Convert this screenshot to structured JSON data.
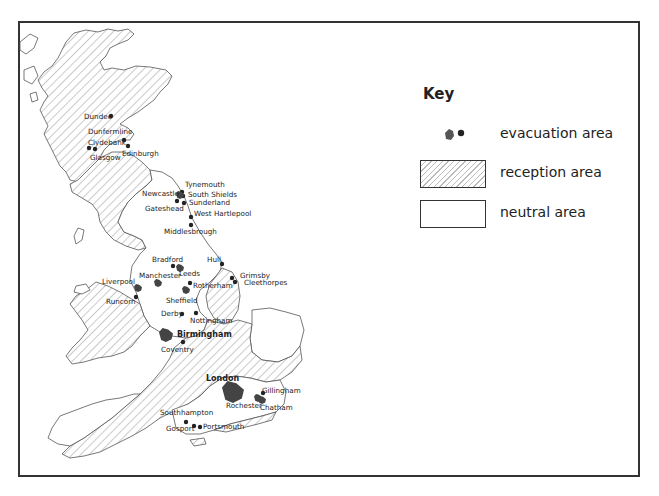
{
  "key": {
    "title": "Key",
    "items": [
      {
        "symbol": "evacuation-symbol",
        "label": "evacuation area"
      },
      {
        "symbol": "hatched-swatch",
        "label": "reception area"
      },
      {
        "symbol": "blank-swatch",
        "label": "neutral area"
      }
    ]
  },
  "colors": {
    "border": "#333333",
    "evacuation": "#444444",
    "hatch": "#999999",
    "background": "#ffffff"
  },
  "cities": [
    {
      "name": "Dundee",
      "x": 111,
      "y": 116,
      "lx": 84,
      "ly": 119,
      "type": "dot"
    },
    {
      "name": "Dunfermline",
      "x": 124,
      "y": 140,
      "lx": 88,
      "ly": 134,
      "type": "dot"
    },
    {
      "name": "Clydebank",
      "x": 89,
      "y": 148,
      "lx": 88,
      "ly": 145,
      "type": "dot"
    },
    {
      "name": "Glasgow",
      "x": 95,
      "y": 149,
      "lx": 90,
      "ly": 160,
      "type": "dot"
    },
    {
      "name": "Edinburgh",
      "x": 128,
      "y": 146,
      "lx": 122,
      "ly": 156,
      "type": "dot"
    },
    {
      "name": "Tynemouth",
      "x": 182,
      "y": 192,
      "lx": 185,
      "ly": 187,
      "type": "dot"
    },
    {
      "name": "South Shields",
      "x": 183,
      "y": 196,
      "lx": 188,
      "ly": 197,
      "type": "dot"
    },
    {
      "name": "Newcastle",
      "x": 180,
      "y": 195,
      "lx": 142,
      "ly": 196,
      "type": "area"
    },
    {
      "name": "Sunderland",
      "x": 184,
      "y": 203,
      "lx": 189,
      "ly": 205,
      "type": "dot"
    },
    {
      "name": "Gateshead",
      "x": 177,
      "y": 201,
      "lx": 145,
      "ly": 211,
      "type": "dot"
    },
    {
      "name": "West Hartlepool",
      "x": 191,
      "y": 217,
      "lx": 194,
      "ly": 216,
      "type": "dot"
    },
    {
      "name": "Middlesbrough",
      "x": 191,
      "y": 225,
      "lx": 164,
      "ly": 234,
      "type": "dot"
    },
    {
      "name": "Bradford",
      "x": 173,
      "y": 266,
      "lx": 152,
      "ly": 262,
      "type": "dot"
    },
    {
      "name": "Leeds",
      "x": 180,
      "y": 268,
      "lx": 179,
      "ly": 276,
      "type": "area"
    },
    {
      "name": "Hull",
      "x": 222,
      "y": 264,
      "lx": 207,
      "ly": 262,
      "type": "dot"
    },
    {
      "name": "Grimsby",
      "x": 232,
      "y": 278,
      "lx": 240,
      "ly": 278,
      "type": "dot"
    },
    {
      "name": "Cleethorpes",
      "x": 235,
      "y": 282,
      "lx": 244,
      "ly": 285,
      "type": "dot"
    },
    {
      "name": "Liverpool",
      "x": 138,
      "y": 288,
      "lx": 102,
      "ly": 284,
      "type": "area"
    },
    {
      "name": "Manchester",
      "x": 158,
      "y": 283,
      "lx": 139,
      "ly": 278,
      "type": "area"
    },
    {
      "name": "Rotherham",
      "x": 190,
      "y": 283,
      "lx": 193,
      "ly": 288,
      "type": "dot"
    },
    {
      "name": "Sheffield",
      "x": 186,
      "y": 290,
      "lx": 166,
      "ly": 303,
      "type": "area"
    },
    {
      "name": "Runcorn",
      "x": 136,
      "y": 297,
      "lx": 106,
      "ly": 304,
      "type": "dot"
    },
    {
      "name": "Derby",
      "x": 182,
      "y": 314,
      "lx": 161,
      "ly": 316,
      "type": "dot"
    },
    {
      "name": "Nottingham",
      "x": 196,
      "y": 313,
      "lx": 190,
      "ly": 323,
      "type": "dot"
    },
    {
      "name": "Birmingham",
      "x": 166,
      "y": 335,
      "lx": 177,
      "ly": 337,
      "type": "area",
      "bold": true
    },
    {
      "name": "Coventry",
      "x": 183,
      "y": 342,
      "lx": 161,
      "ly": 352,
      "type": "dot"
    },
    {
      "name": "London",
      "x": 233,
      "y": 392,
      "lx": 206,
      "ly": 381,
      "type": "area",
      "bold": true
    },
    {
      "name": "Gillingham",
      "x": 263,
      "y": 393,
      "lx": 262,
      "ly": 393,
      "type": "dot"
    },
    {
      "name": "Rochester",
      "x": 258,
      "y": 398,
      "lx": 226,
      "ly": 408,
      "type": "area"
    },
    {
      "name": "Chatham",
      "x": 262,
      "y": 400,
      "lx": 260,
      "ly": 410,
      "type": "area"
    },
    {
      "name": "Southhampton",
      "x": 186,
      "y": 422,
      "lx": 160,
      "ly": 415,
      "type": "dot"
    },
    {
      "name": "Gosport",
      "x": 194,
      "y": 426,
      "lx": 166,
      "ly": 431,
      "type": "dot"
    },
    {
      "name": "Portsmouth",
      "x": 200,
      "y": 427,
      "lx": 203,
      "ly": 429,
      "type": "dot"
    }
  ]
}
